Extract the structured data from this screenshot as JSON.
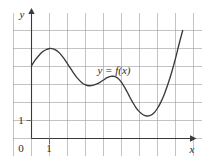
{
  "figure": {
    "kind": "cartesian-graph",
    "background_color": "#ffffff",
    "grid_color": "#9a9a9a",
    "axis_color": "#3a3a3a",
    "curve_color": "#3a3a3a"
  },
  "axes": {
    "x_axis_label": "x",
    "y_axis_label": "y",
    "origin_label": "0",
    "x_tick_label": "1",
    "y_tick_label": "1"
  },
  "annotations": {
    "curve_label": "y = f(x)"
  },
  "chart_data": {
    "type": "line",
    "title": "",
    "subtitle": "",
    "xlabel": "x",
    "ylabel": "y",
    "legend": [
      "y = f(x)"
    ],
    "legend_position": "inline-annotation",
    "grid": true,
    "xlim": [
      -1,
      9
    ],
    "ylim": [
      -1,
      7
    ],
    "x_ticks": [
      0,
      1
    ],
    "y_ticks": [
      0,
      1
    ],
    "x_tick_labels": [
      "0",
      "1"
    ],
    "y_tick_labels": [
      "1"
    ],
    "series": [
      {
        "name": "y = f(x)",
        "x": [
          0.0,
          0.2,
          0.4,
          0.6,
          0.8,
          1.0,
          1.2,
          1.4,
          1.6,
          1.8,
          2.0,
          2.2,
          2.4,
          2.6,
          2.8,
          3.0,
          3.2,
          3.4,
          3.6,
          3.8,
          4.0,
          4.2,
          4.4,
          4.6,
          4.8,
          5.0,
          5.2,
          5.4,
          5.6,
          5.8,
          6.0,
          6.2,
          6.4,
          6.6,
          6.8,
          7.0,
          7.2,
          7.4,
          7.6,
          7.8,
          8.0,
          8.2,
          8.4
        ],
        "y": [
          4.05,
          4.35,
          4.6,
          4.8,
          4.93,
          5.0,
          4.98,
          4.88,
          4.7,
          4.45,
          4.15,
          3.85,
          3.55,
          3.3,
          3.1,
          2.98,
          2.93,
          2.95,
          3.02,
          3.12,
          3.25,
          3.38,
          3.45,
          3.45,
          3.35,
          3.12,
          2.8,
          2.42,
          2.05,
          1.72,
          1.48,
          1.32,
          1.25,
          1.28,
          1.42,
          1.68,
          2.05,
          2.52,
          3.08,
          3.72,
          4.45,
          5.25,
          6.0
        ]
      }
    ],
    "features": {
      "local_maxima": [
        {
          "x": 1.0,
          "y": 5.0
        },
        {
          "x": 4.5,
          "y": 3.45
        }
      ],
      "local_minima": [
        {
          "x": 3.1,
          "y": 2.93
        },
        {
          "x": 6.4,
          "y": 1.25
        }
      ],
      "left_endpoint": {
        "x": 0.0,
        "y": 4.05
      },
      "right_endpoint": {
        "x": 8.4,
        "y": 6.0
      }
    }
  }
}
